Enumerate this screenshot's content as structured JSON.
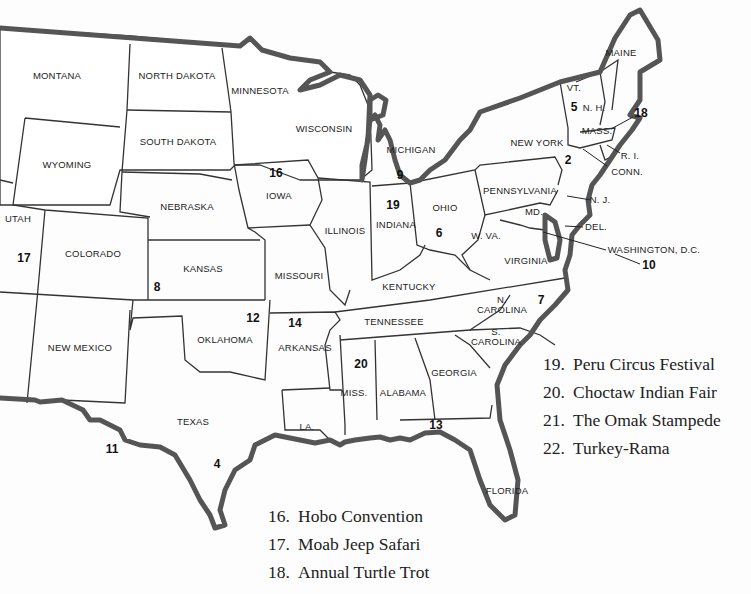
{
  "map": {
    "title": "United States map with numbered festival locations",
    "states": [
      {
        "id": "montana",
        "label": "MONTANA",
        "x": 57,
        "y": 76
      },
      {
        "id": "north-dakota",
        "label": "NORTH DAKOTA",
        "x": 177,
        "y": 76
      },
      {
        "id": "minnesota",
        "label": "MINNESOTA",
        "x": 260,
        "y": 91
      },
      {
        "id": "wisconsin",
        "label": "WISCONSIN",
        "x": 324,
        "y": 129
      },
      {
        "id": "south-dakota",
        "label": "SOUTH DAKOTA",
        "x": 178,
        "y": 142
      },
      {
        "id": "wyoming",
        "label": "WYOMING",
        "x": 67,
        "y": 165
      },
      {
        "id": "iowa",
        "label": "IOWA",
        "x": 279,
        "y": 196
      },
      {
        "id": "nebraska",
        "label": "NEBRASKA",
        "x": 187,
        "y": 207
      },
      {
        "id": "utah",
        "label": "UTAH",
        "x": 18,
        "y": 219
      },
      {
        "id": "colorado",
        "label": "COLORADO",
        "x": 93,
        "y": 254
      },
      {
        "id": "illinois",
        "label": "ILLINOIS",
        "x": 345,
        "y": 231
      },
      {
        "id": "kansas",
        "label": "KANSAS",
        "x": 203,
        "y": 269
      },
      {
        "id": "missouri",
        "label": "MISSOURI",
        "x": 299,
        "y": 276
      },
      {
        "id": "michigan",
        "label": "MICHIGAN",
        "x": 411,
        "y": 150
      },
      {
        "id": "indiana",
        "label": "INDIANA",
        "x": 396,
        "y": 225
      },
      {
        "id": "ohio",
        "label": "OHIO",
        "x": 445,
        "y": 208
      },
      {
        "id": "new-york",
        "label": "NEW YORK",
        "x": 537,
        "y": 143
      },
      {
        "id": "pennsylvania",
        "label": "PENNSYLVANIA",
        "x": 520,
        "y": 191
      },
      {
        "id": "maine",
        "label": "MAINE",
        "x": 621,
        "y": 53
      },
      {
        "id": "vermont",
        "label": "VT.",
        "x": 574,
        "y": 88
      },
      {
        "id": "new-hampshire",
        "label": "N. H.",
        "x": 594,
        "y": 108
      },
      {
        "id": "massachusetts",
        "label": "MASS.",
        "x": 597,
        "y": 131
      },
      {
        "id": "rhode-island",
        "label": "R. I.",
        "x": 630,
        "y": 156
      },
      {
        "id": "connecticut",
        "label": "CONN.",
        "x": 627,
        "y": 172
      },
      {
        "id": "new-jersey",
        "label": "N. J.",
        "x": 600,
        "y": 200
      },
      {
        "id": "maryland",
        "label": "MD.",
        "x": 534,
        "y": 212
      },
      {
        "id": "delaware",
        "label": "DEL.",
        "x": 596,
        "y": 227
      },
      {
        "id": "west-virginia",
        "label": "W. VA.",
        "x": 486,
        "y": 236
      },
      {
        "id": "virginia",
        "label": "VIRGINIA",
        "x": 526,
        "y": 261
      },
      {
        "id": "washington-dc",
        "label": "WASHINGTON, D.C.",
        "x": 654,
        "y": 250
      },
      {
        "id": "kentucky",
        "label": "KENTUCKY",
        "x": 409,
        "y": 287
      },
      {
        "id": "tennessee",
        "label": "TENNESSEE",
        "x": 394,
        "y": 322
      },
      {
        "id": "north-carolina",
        "label": "N.\nCAROLINA",
        "x": 502,
        "y": 305
      },
      {
        "id": "south-carolina",
        "label": "S.\nCAROLINA",
        "x": 496,
        "y": 337
      },
      {
        "id": "new-mexico",
        "label": "NEW MEXICO",
        "x": 80,
        "y": 348
      },
      {
        "id": "oklahoma",
        "label": "OKLAHOMA",
        "x": 225,
        "y": 340
      },
      {
        "id": "arkansas",
        "label": "ARKANSAS",
        "x": 305,
        "y": 348
      },
      {
        "id": "texas",
        "label": "TEXAS",
        "x": 193,
        "y": 422
      },
      {
        "id": "louisiana",
        "label": "LA.",
        "x": 307,
        "y": 427
      },
      {
        "id": "mississippi",
        "label": "MISS.",
        "x": 354,
        "y": 393
      },
      {
        "id": "alabama",
        "label": "ALABAMA",
        "x": 403,
        "y": 393
      },
      {
        "id": "georgia",
        "label": "GEORGIA",
        "x": 454,
        "y": 373
      },
      {
        "id": "florida",
        "label": "FLORIDA",
        "x": 507,
        "y": 491
      }
    ],
    "markers": [
      {
        "num": "2",
        "x": 568,
        "y": 160
      },
      {
        "num": "4",
        "x": 217,
        "y": 464
      },
      {
        "num": "5",
        "x": 574,
        "y": 107
      },
      {
        "num": "6",
        "x": 439,
        "y": 233
      },
      {
        "num": "7",
        "x": 541,
        "y": 300
      },
      {
        "num": "8",
        "x": 157,
        "y": 287
      },
      {
        "num": "9",
        "x": 400,
        "y": 175
      },
      {
        "num": "10",
        "x": 649,
        "y": 265
      },
      {
        "num": "11",
        "x": 112,
        "y": 449
      },
      {
        "num": "12",
        "x": 253,
        "y": 318
      },
      {
        "num": "13",
        "x": 436,
        "y": 425
      },
      {
        "num": "14",
        "x": 295,
        "y": 323
      },
      {
        "num": "16",
        "x": 276,
        "y": 173
      },
      {
        "num": "17",
        "x": 24,
        "y": 258
      },
      {
        "num": "18",
        "x": 641,
        "y": 113
      },
      {
        "num": "19",
        "x": 393,
        "y": 205
      },
      {
        "num": "20",
        "x": 361,
        "y": 364
      }
    ]
  },
  "legend": {
    "column_left": [
      {
        "num": "16.",
        "label": "Hobo Convention"
      },
      {
        "num": "17.",
        "label": "Moab Jeep Safari"
      },
      {
        "num": "18.",
        "label": "Annual Turtle Trot"
      }
    ],
    "column_right": [
      {
        "num": "19.",
        "label": "Peru Circus Festival"
      },
      {
        "num": "20.",
        "label": "Choctaw Indian Fair"
      },
      {
        "num": "21.",
        "label": "The Omak Stampede"
      },
      {
        "num": "22.",
        "label": "Turkey-Rama"
      }
    ]
  }
}
